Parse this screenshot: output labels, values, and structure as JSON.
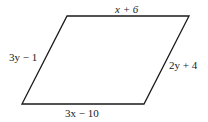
{
  "diagram": {
    "type": "parallelogram",
    "stroke_color": "#1a1a1a",
    "background": "#ffffff",
    "vertices": {
      "top_left": [
        67,
        16
      ],
      "top_right": [
        189,
        16
      ],
      "bottom_right": [
        144,
        104
      ],
      "bottom_left": [
        22,
        104
      ]
    },
    "sides": {
      "top": "x + 6",
      "left": "3y − 1",
      "right": "2y + 4",
      "bottom": "3x − 10"
    }
  }
}
